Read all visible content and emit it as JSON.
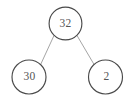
{
  "diagram": {
    "type": "binary-tree",
    "title": "",
    "background_color": "#ffffff",
    "node_fill": "#ffffff",
    "node_stroke": "#4a4a4a",
    "edge_color": "#9a9a9a",
    "label_color": "#555555",
    "nodes": [
      {
        "id": "root",
        "label": "32",
        "cx": 65.5,
        "cy": 23.5,
        "r": 16.4,
        "role": "root"
      },
      {
        "id": "left",
        "label": "30",
        "cx": 29.0,
        "cy": 77.0,
        "r": 17.0,
        "role": "left-child"
      },
      {
        "id": "right",
        "label": "2",
        "cx": 105.5,
        "cy": 77.0,
        "r": 17.0,
        "role": "right-child"
      }
    ],
    "edges": [
      {
        "from": "root",
        "to": "left",
        "x1": 54.0,
        "y1": 35.5,
        "x2": 40.7,
        "y2": 64.4
      },
      {
        "from": "root",
        "to": "right",
        "x1": 77.0,
        "y1": 35.5,
        "x2": 94.0,
        "y2": 64.4
      }
    ]
  }
}
